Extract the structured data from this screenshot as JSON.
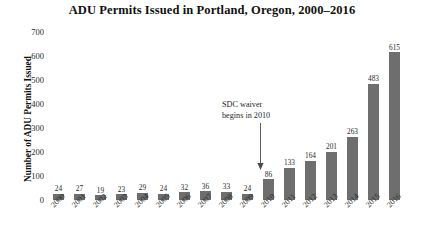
{
  "chart_data": {
    "type": "bar",
    "title": "ADU Permits Issued in Portland, Oregon, 2000–2016",
    "xlabel": "",
    "ylabel": "Number of ADU Permits Issued",
    "ylim": [
      0,
      700
    ],
    "yticks": [
      0,
      100,
      200,
      300,
      400,
      500,
      600,
      700
    ],
    "ytick_labels": [
      "0",
      "100",
      "200",
      "300",
      "400",
      "500",
      "600",
      "700"
    ],
    "grid": false,
    "legend": false,
    "bar_color": "#6e6e6e",
    "background_color": "#ffffff",
    "categories": [
      "2000",
      "2001",
      "2002",
      "2003",
      "2004",
      "2005",
      "2006",
      "2007",
      "2008",
      "2009",
      "2010",
      "2011",
      "2012",
      "2013",
      "2014",
      "2015",
      "2016"
    ],
    "values": [
      24,
      27,
      19,
      23,
      29,
      24,
      32,
      36,
      33,
      24,
      86,
      133,
      164,
      201,
      263,
      483,
      615
    ],
    "data_labels": [
      "24",
      "27",
      "19",
      "23",
      "29",
      "24",
      "32",
      "36",
      "33",
      "24",
      "86",
      "133",
      "164",
      "201",
      "263",
      "483",
      "615"
    ],
    "annotations": [
      {
        "text_line_1": "SDC waiver",
        "text_line_2": "begins in 2010",
        "points_to_category": "2010",
        "style": "down-arrow"
      }
    ]
  }
}
